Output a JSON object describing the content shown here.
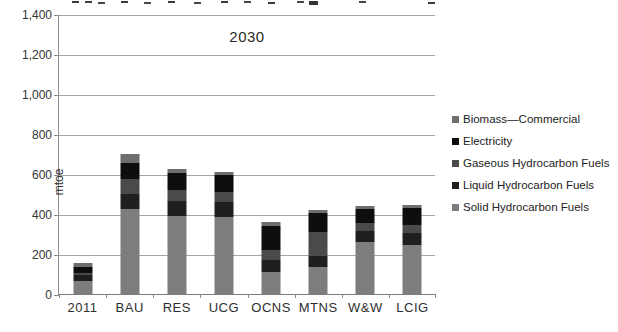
{
  "chart_data": {
    "type": "bar",
    "stacked": true,
    "title": "2030",
    "ylabel": "mtoe",
    "ylim": [
      0,
      1400
    ],
    "ytick_step": 200,
    "grid": true,
    "legend_position": "right",
    "categories": [
      "2011",
      "BAU",
      "RES",
      "UCG",
      "OCNS",
      "MTNS",
      "W&W",
      "LCIG"
    ],
    "series": [
      {
        "name": "Solid Hydrocarbon Fuels",
        "color": "#7d7d7d",
        "values": [
          65,
          425,
          390,
          385,
          110,
          135,
          260,
          245
        ]
      },
      {
        "name": "Liquid Hydrocarbon Fuels",
        "color": "#1f1f1f",
        "values": [
          30,
          75,
          75,
          75,
          60,
          55,
          55,
          60
        ]
      },
      {
        "name": "Gaseous Hydrocarbon Fuels",
        "color": "#4a4a4a",
        "values": [
          10,
          75,
          55,
          50,
          50,
          120,
          40,
          40
        ]
      },
      {
        "name": "Electricity",
        "color": "#0e0e0e",
        "values": [
          30,
          80,
          85,
          85,
          120,
          95,
          70,
          85
        ]
      },
      {
        "name": "Biomass—Commercial",
        "color": "#6e6e6e",
        "values": [
          20,
          45,
          20,
          15,
          20,
          15,
          15,
          15
        ]
      }
    ],
    "legend_top_to_bottom": [
      "Biomass—Commercial",
      "Electricity",
      "Gaseous Hydrocarbon Fuels",
      "Liquid Hydrocarbon Fuels",
      "Solid Hydrocarbon Fuels"
    ],
    "axis_colors": {
      "gridline": "#a6a6a6",
      "axis": "#8c8c8c",
      "text": "#2e2e2e"
    }
  }
}
